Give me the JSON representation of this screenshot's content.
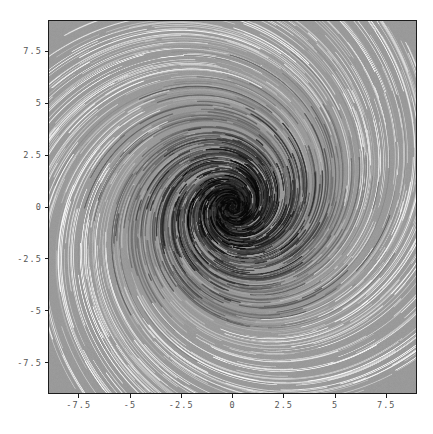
{
  "figure": {
    "background_color": "#ffffff",
    "axes_face_color": "#9a9a9a",
    "axes_edge_color": "#1c1c1c",
    "tick_label_color": "#555555"
  },
  "axes": {
    "x_tick_labels": [
      "-7.5",
      "-5",
      "-2.5",
      "0",
      "2.5",
      "5",
      "7.5"
    ],
    "x_tick_values": [
      -7.5,
      -5,
      -2.5,
      0,
      2.5,
      5,
      7.5
    ],
    "y_tick_labels": [
      "7.5",
      "5",
      "2.5",
      "0",
      "-2.5",
      "-5",
      "-7.5"
    ],
    "y_tick_values": [
      7.5,
      5,
      2.5,
      0,
      -2.5,
      -5,
      -7.5
    ],
    "xlim": [
      -9.0,
      9.0
    ],
    "ylim": [
      -9.0,
      9.0
    ],
    "xlabel": "",
    "ylabel": "",
    "title": ""
  },
  "chart_data": {
    "type": "line",
    "plot_kind": "streamplot-spiral-vortex",
    "title": "",
    "xlabel": "",
    "ylabel": "",
    "xlim": [
      -9.0,
      9.0
    ],
    "ylim": [
      -9.0,
      9.0
    ],
    "xticks": [
      -7.5,
      -5,
      -2.5,
      0,
      2.5,
      5,
      7.5
    ],
    "yticks": [
      -7.5,
      -5,
      -2.5,
      0,
      2.5,
      5,
      7.5
    ],
    "grid": false,
    "legend": null,
    "background": "#9a9a9a",
    "colormap": "gray",
    "color_by": "radius",
    "color_dark": "#141414",
    "color_light": "#e6e6e6",
    "center": [
      0.0,
      0.0
    ],
    "spiral": {
      "direction": "counterclockwise",
      "arms": 12,
      "pitch_b": 0.3,
      "r_min": 0.18,
      "r_max": 9.6,
      "theta_turns": 2.6
    },
    "series": [
      {
        "name": "streamlines",
        "count": 360,
        "linewidth_range": [
          0.7,
          2.6
        ],
        "description": "Logarithmic spiral streamlines of a rotating sink vortex field, r(theta)=r0*exp(b*theta); segments rendered as dashed arc fragments with grayscale shading keyed to radius"
      }
    ],
    "annotations": []
  }
}
